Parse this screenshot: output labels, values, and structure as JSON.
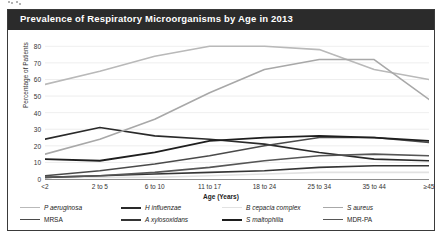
{
  "figure": {
    "title": "Prevalence of Respiratory Microorganisms by Age in 2013",
    "title_bar_color": "#2b2b2b",
    "border_color": "#3a3a3a"
  },
  "chart_data": {
    "type": "line",
    "title": "Prevalence of Respiratory Microorganisms by Age in 2013",
    "xlabel": "Age (Years)",
    "ylabel": "Percentage of Patients",
    "ylim": [
      0,
      85
    ],
    "yticks": [
      0,
      10,
      20,
      30,
      40,
      50,
      60,
      70,
      80
    ],
    "grid": "horizontal",
    "legend_position": "bottom",
    "categories": [
      "<2",
      "2 to 5",
      "6 to 10",
      "11 to 17",
      "18 to 24",
      "25 to 34",
      "35 to 44",
      "≥45"
    ],
    "series": [
      {
        "name": "P aeruginosa",
        "color": "#b9b9b9",
        "width": 1.6,
        "values": [
          57,
          65,
          74,
          80,
          80,
          78,
          66,
          60
        ]
      },
      {
        "name": "H influenzae",
        "color": "#2a2a2a",
        "width": 1.6,
        "values": [
          24,
          31,
          26,
          24,
          21,
          16,
          12,
          11
        ]
      },
      {
        "name": "B cepacia complex",
        "color": "#e2e2e2",
        "width": 1.6,
        "values": [
          1,
          1,
          1,
          2,
          3,
          4,
          4,
          4
        ]
      },
      {
        "name": "S aureus",
        "color": "#a8a8a8",
        "width": 1.6,
        "values": [
          15,
          24,
          36,
          52,
          66,
          72,
          72,
          48
        ]
      },
      {
        "name": "MRSA",
        "color": "#4a4a4a",
        "width": 1.6,
        "values": [
          2,
          5,
          9,
          14,
          20,
          25,
          25,
          22
        ]
      },
      {
        "name": "A xylosoxidans",
        "color": "#353535",
        "width": 1.6,
        "values": [
          1,
          2,
          3,
          4,
          5,
          7,
          8,
          8
        ]
      },
      {
        "name": "S maltophilia",
        "color": "#1e1e1e",
        "width": 1.8,
        "values": [
          12,
          11,
          16,
          23,
          25,
          26,
          25,
          23
        ]
      },
      {
        "name": "MDR-PA",
        "color": "#565656",
        "width": 1.6,
        "values": [
          1,
          2,
          4,
          7,
          11,
          14,
          15,
          14
        ]
      }
    ]
  },
  "legend": {
    "rows": [
      [
        {
          "label": "P aeruginosa",
          "color": "#b9b9b9",
          "width": 1.6,
          "italic": true
        },
        {
          "label": "H influenzae",
          "color": "#2a2a2a",
          "width": 2.2,
          "italic": true
        },
        {
          "label": "B cepacia complex",
          "color": "#e2e2e2",
          "width": 1.6,
          "italic": true
        },
        {
          "label": "S aureus",
          "color": "#a8a8a8",
          "width": 1.6,
          "italic": true
        }
      ],
      [
        {
          "label": "MRSA",
          "color": "#4a4a4a",
          "width": 1.8,
          "italic": false
        },
        {
          "label": "A xylosoxidans",
          "color": "#353535",
          "width": 2.2,
          "italic": true
        },
        {
          "label": "S maltophilia",
          "color": "#1e1e1e",
          "width": 2.2,
          "italic": true
        },
        {
          "label": "MDR-PA",
          "color": "#565656",
          "width": 1.8,
          "italic": false
        }
      ]
    ]
  }
}
